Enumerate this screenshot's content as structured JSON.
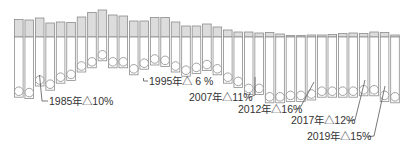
{
  "chart_data": {
    "type": "bar",
    "title": "",
    "xlabel": "",
    "ylabel": "",
    "grid": false,
    "legend": "none",
    "categories": [
      "1983",
      "1984",
      "1985",
      "1986",
      "1987",
      "1988",
      "1989",
      "1990",
      "1991",
      "1992",
      "1993",
      "1994",
      "1995",
      "1996",
      "1997",
      "1998",
      "1999",
      "2000",
      "2001",
      "2002",
      "2003",
      "2004",
      "2005",
      "2006",
      "2007",
      "2008",
      "2009",
      "2010",
      "2011",
      "2012",
      "2013",
      "2014",
      "2015",
      "2016",
      "2017",
      "2018",
      "2019"
    ],
    "series": [
      {
        "name": "upper (gray)",
        "values": [
          17.5,
          17,
          19,
          14,
          15,
          14.5,
          20,
          24.5,
          27,
          22,
          21,
          16,
          16,
          19.5,
          19.5,
          15,
          11,
          11,
          13,
          10,
          7,
          5,
          5,
          4,
          4.5,
          3,
          1.5,
          1.5,
          2,
          2,
          2.5,
          3.5,
          4,
          3.5,
          5,
          4.5,
          2
        ]
      },
      {
        "name": "lower (white) with circle markers",
        "values": [
          -43,
          -44,
          -35,
          -38,
          -33,
          -31,
          -25,
          -22,
          -17,
          -22,
          -22,
          -27,
          -23,
          -20,
          -21,
          -25,
          -28,
          -26,
          -24,
          -27,
          -33,
          -36,
          -41,
          -41,
          -47,
          -47,
          -46,
          -46,
          -45,
          -43,
          -43,
          -43,
          -43,
          -42,
          -42,
          -46,
          -47
        ]
      }
    ],
    "annotations": [
      {
        "year": "1985",
        "text": "1985年△10%"
      },
      {
        "year": "1995",
        "text": "1995年△ 6 %"
      },
      {
        "year": "2007",
        "text": "2007年△11%"
      },
      {
        "year": "2012",
        "text": "2012年△16%"
      },
      {
        "year": "2017",
        "text": "2017年△12%"
      },
      {
        "year": "2019",
        "text": "2019年△15%"
      }
    ],
    "colors": {
      "upper_fill": "#dcdcdc",
      "lower_fill": "#ffffff",
      "stroke": "#8c8c8c",
      "text": "#333333"
    }
  },
  "labels": {
    "a1985": "1985年△10%",
    "a1995": "1995年△ 6 %",
    "a2007": "2007年△11%",
    "a2012": "2012年△16%",
    "a2017": "2017年△12%",
    "a2019": "2019年△15%"
  }
}
